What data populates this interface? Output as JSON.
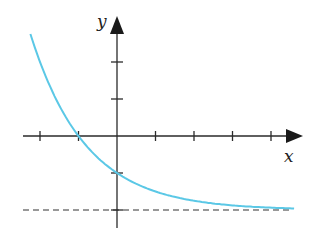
{
  "chart_data": {
    "type": "line",
    "title": "",
    "xlabel": "x",
    "ylabel": "y",
    "function": "y = 2^(-x) - 2",
    "x_ticks": [
      -2,
      -1,
      0,
      1,
      2,
      3,
      4
    ],
    "y_ticks": [
      -2,
      -1,
      1,
      2
    ],
    "tick_labels_shown": false,
    "xlim": [
      -2.3,
      4.7
    ],
    "ylim": [
      -2.5,
      3.0
    ],
    "grid": false,
    "legend": null,
    "series": [
      {
        "name": "exponential decay curve",
        "color": "#5bc8e6",
        "x": [
          -2.25,
          -2,
          -1.5,
          -1,
          -0.5,
          0,
          0.5,
          1,
          1.5,
          2,
          2.5,
          3,
          3.5,
          4,
          4.6
        ],
        "y": [
          2.76,
          2.0,
          0.83,
          0.0,
          -0.59,
          -1.0,
          -1.29,
          -1.5,
          -1.65,
          -1.75,
          -1.82,
          -1.88,
          -1.91,
          -1.94,
          -1.96
        ]
      }
    ],
    "annotations": [
      {
        "type": "horizontal_asymptote",
        "y": -2,
        "style": "dashed",
        "color": "#333333"
      },
      {
        "type": "x_intercept",
        "x": -1,
        "y": 0
      },
      {
        "type": "y_intercept",
        "x": 0,
        "y": -1
      }
    ]
  },
  "labels": {
    "x_axis": "x",
    "y_axis": "y"
  },
  "colors": {
    "curve": "#5bc8e6",
    "axes": "#2a2a2a",
    "asymptote": "#333333"
  }
}
